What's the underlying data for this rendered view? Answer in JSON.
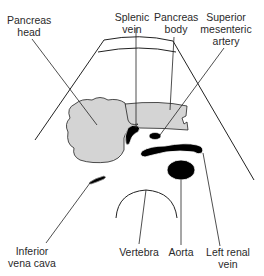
{
  "diagram": {
    "labels": {
      "pancreas_head": [
        "Pancreas",
        "head"
      ],
      "splenic_vein": [
        "Splenic",
        "vein"
      ],
      "pancreas_body": [
        "Pancreas",
        "body"
      ],
      "sma": [
        "Superior",
        "mesenteric",
        "artery"
      ],
      "ivc": [
        "Inferior",
        "vena cava"
      ],
      "vertebra": [
        "Vertebra"
      ],
      "aorta": [
        "Aorta"
      ],
      "left_renal_vein": [
        "Left renal",
        "vein"
      ]
    },
    "colors": {
      "pancreas_fill": "#d4d4d4",
      "vessel_fill": "#000000",
      "line": "#222222",
      "background": "#ffffff"
    }
  }
}
